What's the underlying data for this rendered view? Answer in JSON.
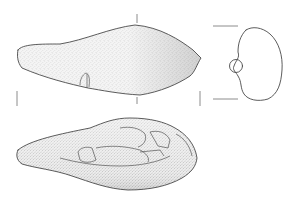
{
  "figure": {
    "type": "archaeological-artifact-illustration",
    "views": [
      {
        "id": "upper-face",
        "rendering": "stippled",
        "has_scar": true
      },
      {
        "id": "cross-section",
        "rendering": "outline"
      },
      {
        "id": "lower-face",
        "rendering": "stippled-with-flake-scars"
      }
    ],
    "colors": {
      "ink": "#4a4a4a",
      "stipple_light": "#d9d9d9",
      "stipple_dark": "#9a9a9a",
      "background": "#ffffff"
    },
    "labels": []
  }
}
